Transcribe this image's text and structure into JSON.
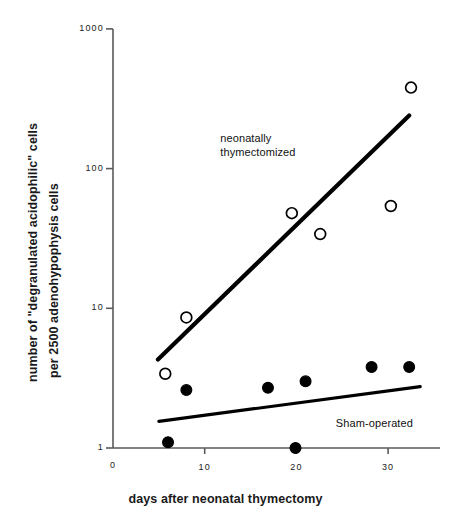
{
  "chart_data": {
    "type": "scatter",
    "title": "",
    "xlabel": "days after neonatal thymectomy",
    "ylabel": "number of \"degranulated acidophilic\" cells per 2500 adenohypophysis cells",
    "ylabel_line1": "number of \"degranulated acidophilic\" cells",
    "ylabel_line2": "per 2500 adenohypophysis cells",
    "yscale": "log",
    "ylim": [
      1,
      1000
    ],
    "xlim": [
      0,
      34
    ],
    "grid": false,
    "legend_position": "inline-annotations",
    "yticks": [
      1,
      10,
      100,
      1000
    ],
    "ytick_labels": [
      "1",
      "10",
      "100",
      "1000"
    ],
    "xticks": [
      0,
      10,
      20,
      30
    ],
    "xtick_labels": [
      "0",
      "10",
      "20",
      "30"
    ],
    "x_origin_label": "0",
    "series": [
      {
        "name": "neonatally thymectomized",
        "marker": "open-circle",
        "color": "#000000",
        "points": [
          {
            "x": 5.7,
            "y": 3.4
          },
          {
            "x": 8.0,
            "y": 8.6
          },
          {
            "x": 19.5,
            "y": 48
          },
          {
            "x": 22.6,
            "y": 34
          },
          {
            "x": 30.3,
            "y": 54
          },
          {
            "x": 32.5,
            "y": 380
          }
        ],
        "trendline": {
          "x1": 4.9,
          "y1": 4.3,
          "x2": 32.3,
          "y2": 240
        }
      },
      {
        "name": "Sham-operated",
        "marker": "filled-circle",
        "color": "#000000",
        "points": [
          {
            "x": 6.0,
            "y": 1.1
          },
          {
            "x": 8.0,
            "y": 2.6
          },
          {
            "x": 16.9,
            "y": 2.7
          },
          {
            "x": 19.9,
            "y": 1.0
          },
          {
            "x": 21.0,
            "y": 3.0
          },
          {
            "x": 28.2,
            "y": 3.8
          },
          {
            "x": 32.3,
            "y": 3.8
          }
        ],
        "trendline": {
          "x1": 5.0,
          "y1": 1.55,
          "x2": 33.5,
          "y2": 2.75
        }
      }
    ],
    "annotations": [
      {
        "name": "neonatally-thymectomized",
        "line1": "neonatally",
        "line2": "thymectomized",
        "x": 11.7,
        "y": 165
      },
      {
        "name": "sham-operated",
        "line1": "Sham-operated",
        "line2": "",
        "x": 24.3,
        "y": 1.52
      }
    ]
  }
}
